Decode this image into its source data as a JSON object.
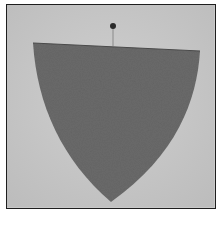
{
  "figure": {
    "colors": {
      "background": "#c9c9c9",
      "fabric": "#6a6a6a",
      "frame_border": "#1e1e1e",
      "pin_head": "#2a2a2a"
    }
  },
  "caption": {
    "text": ""
  }
}
